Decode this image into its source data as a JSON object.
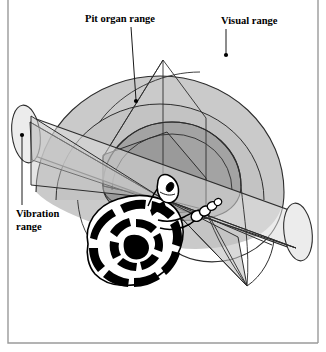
{
  "figure": {
    "type": "diagram",
    "background_color": "#ffffff",
    "frame_color": "#8a8a8a"
  },
  "labels": [
    {
      "id": "pit-organ-range",
      "text": "Pit organ range",
      "text_x": 85,
      "text_y": 22,
      "anchor": "start",
      "leader": {
        "x1": 131,
        "y1": 27,
        "x2": 136,
        "y2": 100
      },
      "dot": {
        "cx": 136,
        "cy": 101,
        "r": 2.1
      }
    },
    {
      "id": "visual-range",
      "text": "Visual range",
      "text_x": 221,
      "text_y": 24,
      "anchor": "start",
      "leader": {
        "x1": 226,
        "y1": 29,
        "x2": 226,
        "y2": 54
      },
      "dot": {
        "cx": 226,
        "cy": 55,
        "r": 2.1
      }
    },
    {
      "id": "vibration-range",
      "text": "Vibration range",
      "lines": [
        "Vibration",
        "range"
      ],
      "text_x": 16,
      "text_y": 217,
      "line_height": 13,
      "anchor": "start",
      "leader": {
        "x1": 22,
        "y1": 205,
        "x2": 22,
        "y2": 136
      },
      "dot": {
        "cx": 22,
        "cy": 135,
        "r": 2.1
      }
    }
  ],
  "regions": [
    {
      "id": "visual-dome",
      "label": "Visual range",
      "fill": "#c9c9c9",
      "stroke": "#2a2a2a"
    },
    {
      "id": "pit-dome",
      "label": "Pit organ range",
      "fill": "#a6a6a6",
      "stroke": "#2a2a2a"
    },
    {
      "id": "pit-cone",
      "label": "Pit organ cone",
      "fill": "#b5b5b5",
      "stroke": "#2a2a2a"
    },
    {
      "id": "vibration-cylinder",
      "label": "Vibration range",
      "fill": "#dedede",
      "stroke": "#2a2a2a"
    },
    {
      "id": "ground-plane",
      "label": "Ground plane",
      "fill": "#bdbdbd",
      "stroke": "#2a2a2a"
    }
  ],
  "snake": {
    "id": "rattlesnake",
    "body_fill": "#ffffff",
    "pattern_fill": "#000000",
    "outline": "#000000",
    "parts": [
      "coiled body",
      "head",
      "neck",
      "rattle"
    ]
  }
}
